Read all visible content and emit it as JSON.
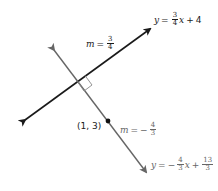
{
  "diagram": {
    "colors": {
      "line1": "#1a1a1a",
      "line2": "#666666",
      "background": "#ffffff"
    },
    "line1": {
      "equation": {
        "lhs": "y",
        "eq": "=",
        "coef_num": "3",
        "coef_den": "4",
        "var": "x",
        "op": "+",
        "const": "4"
      },
      "slope_label": {
        "m": "m",
        "eq": "=",
        "num": "3",
        "den": "4"
      }
    },
    "line2": {
      "equation": {
        "lhs": "y",
        "eq": "=",
        "sign": "−",
        "coef_num": "4",
        "coef_den": "3",
        "var": "x",
        "op": "+",
        "const_num": "13",
        "const_den": "3"
      },
      "slope_label": {
        "m": "m",
        "eq": "=",
        "sign": "−",
        "num": "4",
        "den": "3"
      }
    },
    "point": {
      "label": "(1, 3)"
    },
    "right_angle_marker": "right-angle"
  }
}
